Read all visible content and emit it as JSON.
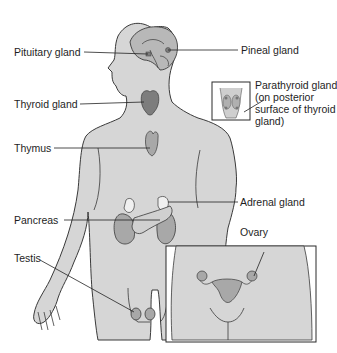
{
  "diagram": {
    "type": "anatomical-illustration",
    "colors": {
      "body_fill": "#d6d6d6",
      "outline": "#3a3a3a",
      "gland_fill": "#a8a8a8",
      "gland_dark": "#7d7d7d",
      "light_fill": "#f0f0f0",
      "leader_line": "#222222"
    },
    "labels": {
      "pituitary": "Pituitary gland",
      "pineal": "Pineal gland",
      "thyroid": "Thyroid gland",
      "parathyroid_line1": "Parathyroid gland",
      "parathyroid_line2": "(on posterior",
      "parathyroid_line3": "surface of thyroid",
      "parathyroid_line4": "gland)",
      "thymus": "Thymus",
      "adrenal": "Adrenal gland",
      "pancreas": "Pancreas",
      "ovary": "Ovary",
      "testis": "Testis"
    },
    "insets": [
      {
        "name": "parathyroid-inset",
        "shows": "posterior view of thyroid with parathyroid glands"
      },
      {
        "name": "female-pelvis-inset",
        "shows": "female pelvis with ovaries and uterus"
      }
    ]
  }
}
